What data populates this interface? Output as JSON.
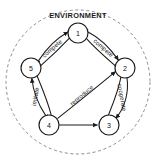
{
  "diagram": {
    "title": "ENVIRONMENT",
    "style": {
      "background": "#ffffff",
      "ink": "#1b1b1b",
      "dashed_border": "#8d8d8d"
    },
    "boundary": {
      "shape": "dashed-circle",
      "label": "ENVIRONMENT"
    },
    "nodes": [
      {
        "id": "n1",
        "label": "1",
        "cx": 78,
        "cy": 33,
        "r": 10
      },
      {
        "id": "n2",
        "label": "2",
        "cx": 125,
        "cy": 68,
        "r": 10
      },
      {
        "id": "n3",
        "label": "3",
        "cx": 109,
        "cy": 125,
        "r": 10
      },
      {
        "id": "n4",
        "label": "4",
        "cx": 49,
        "cy": 125,
        "r": 10
      },
      {
        "id": "n5",
        "label": "5",
        "cx": 31,
        "cy": 68,
        "r": 10
      }
    ],
    "edges": [
      {
        "id": "e-5-1",
        "from": "n5",
        "to": "n1",
        "label": "compete",
        "kind": "curved",
        "arrows": "both"
      },
      {
        "id": "e-1-2",
        "from": "n1",
        "to": "n2",
        "label": "compete",
        "kind": "curved",
        "arrows": "both"
      },
      {
        "id": "e-2-3",
        "from": "n2",
        "to": "n3",
        "label": "cooperate",
        "kind": "curved",
        "arrows": "both"
      },
      {
        "id": "e-4-5",
        "from": "n4",
        "to": "n5",
        "label": "imitate",
        "kind": "curved",
        "arrows": "both"
      },
      {
        "id": "e-4-2",
        "from": "n4",
        "to": "n2",
        "label": "reproduce",
        "kind": "curved",
        "arrows": "forward"
      },
      {
        "id": "e-4-3",
        "from": "n4",
        "to": "n3",
        "label": "",
        "kind": "straight",
        "arrows": "forward"
      }
    ]
  }
}
